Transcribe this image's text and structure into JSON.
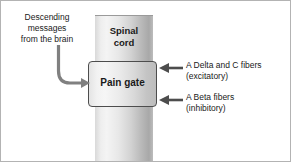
{
  "figure": {
    "background": "#ffffff",
    "border_color": "#b3b3b3",
    "width": 291,
    "height": 162
  },
  "diagram": {
    "column": {
      "name": "spinal cord column",
      "label": "Spinal\ncord",
      "fill_light": "#f4f4f4",
      "fill_dark": "#a8a8a8"
    },
    "gate": {
      "name": "pain gate",
      "label": "Pain gate",
      "border_color": "#4d4d4d",
      "fill_light": "#f6f6f6",
      "fill_dark": "#bdbdbd"
    },
    "annotations": [
      {
        "id": "descending",
        "text": "Descending\nmessages\nfrom the brain",
        "arrow": "curved-arrow-right",
        "arrow_color": "#808080",
        "position": "left"
      },
      {
        "id": "excitatory",
        "text": "A Delta and C fibers\n(excitatory)",
        "arrow": "arrow-left",
        "arrow_color": "#4d4d4d",
        "position": "right-top"
      },
      {
        "id": "inhibitory",
        "text": "A Beta fibers\n(inhibitory)",
        "arrow": "arrow-left",
        "arrow_color": "#4d4d4d",
        "position": "right-bottom"
      }
    ]
  }
}
